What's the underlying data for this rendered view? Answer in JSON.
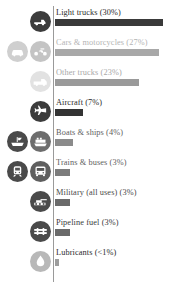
{
  "chart_data": {
    "type": "bar",
    "title": "",
    "subtitle": "",
    "xlabel": "",
    "ylabel": "",
    "orientation": "horizontal",
    "grid": false,
    "legend": "none",
    "xlim": [
      0,
      30
    ],
    "categories": [
      "Light trucks",
      "Cars & motorcycles",
      "Other trucks",
      "Aircraft",
      "Boats & ships",
      "Trains & buses",
      "Military (all uses)",
      "Pipeline fuel",
      "Lubricants"
    ],
    "values": [
      30,
      27,
      23,
      7,
      4,
      3,
      3,
      3,
      0.5
    ],
    "value_labels": [
      "30%",
      "27%",
      "23%",
      "7%",
      "4%",
      "3%",
      "3%",
      "3%",
      "<1%"
    ],
    "bar_colors": [
      "#3a3a3a",
      "#9d9d9d",
      "#8f8f8f",
      "#333333",
      "#8f8f8f",
      "#8f8f8f",
      "#5a5a5a",
      "#5a5a5a",
      "#9d9d9d"
    ]
  },
  "colors": {
    "dark": "#3a3a3a",
    "mid": "#8f8f8f",
    "light": "#b9b9b9",
    "axis": "#9a9a9a",
    "text_dark": "#2b2b2b",
    "text_light": "#b0b0b0",
    "text_mid": "#6f6f6f"
  },
  "rows": [
    {
      "key": "light-trucks",
      "label": "Light trucks (30%)",
      "percent": 30,
      "bar_width_px": 108,
      "bar_color": "#3a3a3a",
      "label_color": "#2b2b2b",
      "icons": [
        {
          "name": "pickup-truck-icon",
          "glyph": "truck",
          "badge_color": "#3c3c3c",
          "mark_color": "#ffffff"
        }
      ]
    },
    {
      "key": "cars-motorcycles",
      "label": "Cars & motorcycles (27%)",
      "percent": 27,
      "bar_width_px": 104,
      "bar_color": "#a8a8a8",
      "label_color": "#b4b4b4",
      "icons": [
        {
          "name": "car-icon",
          "glyph": "car",
          "badge_color": "#cfcfcf",
          "mark_color": "#ffffff"
        },
        {
          "name": "motorcycle-icon",
          "glyph": "motorcycle",
          "badge_color": "#c4c4c4",
          "mark_color": "#ffffff"
        }
      ]
    },
    {
      "key": "other-trucks",
      "label": "Other trucks (23%)",
      "percent": 23,
      "bar_width_px": 84,
      "bar_color": "#9a9a9a",
      "label_color": "#a8a8a8",
      "icons": [
        {
          "name": "semi-truck-icon",
          "glyph": "semi",
          "badge_color": "#e2e2e2",
          "mark_color": "#ffffff"
        }
      ]
    },
    {
      "key": "aircraft",
      "label": "Aircraft (7%)",
      "percent": 7,
      "bar_width_px": 28,
      "bar_color": "#333333",
      "label_color": "#2b2b2b",
      "icons": [
        {
          "name": "airplane-icon",
          "glyph": "plane",
          "badge_color": "#3c3c3c",
          "mark_color": "#ffffff"
        }
      ]
    },
    {
      "key": "boats-ships",
      "label": "Boats & ships (4%)",
      "percent": 4,
      "bar_width_px": 18,
      "bar_color": "#8b8b8b",
      "label_color": "#5e5e5e",
      "icons": [
        {
          "name": "boat-icon",
          "glyph": "boat",
          "badge_color": "#4a4a4a",
          "mark_color": "#ffffff"
        },
        {
          "name": "ship-icon",
          "glyph": "ship",
          "badge_color": "#6d6d6d",
          "mark_color": "#ffffff"
        }
      ]
    },
    {
      "key": "trains-buses",
      "label": "Trains & buses (3%)",
      "percent": 3,
      "bar_width_px": 15,
      "bar_color": "#7c7c7c",
      "label_color": "#5e5e5e",
      "icons": [
        {
          "name": "train-icon",
          "glyph": "train",
          "badge_color": "#4a4a4a",
          "mark_color": "#ffffff"
        },
        {
          "name": "bus-icon",
          "glyph": "bus",
          "badge_color": "#5f5f5f",
          "mark_color": "#ffffff"
        }
      ]
    },
    {
      "key": "military",
      "label": "Military (all uses) (3%)",
      "percent": 3,
      "bar_width_px": 15,
      "bar_color": "#6a6a6a",
      "label_color": "#4a4a4a",
      "icons": [
        {
          "name": "tank-icon",
          "glyph": "tank",
          "badge_color": "#4a4a4a",
          "mark_color": "#ffffff"
        }
      ]
    },
    {
      "key": "pipeline-fuel",
      "label": "Pipeline fuel (3%)",
      "percent": 3,
      "bar_width_px": 15,
      "bar_color": "#6a6a6a",
      "label_color": "#3a3a3a",
      "icons": [
        {
          "name": "pipeline-icon",
          "glyph": "pipeline",
          "badge_color": "#4a4a4a",
          "mark_color": "#ffffff"
        }
      ]
    },
    {
      "key": "lubricants",
      "label": "Lubricants (<1%)",
      "percent": 0.5,
      "bar_width_px": 4,
      "bar_color": "#9d9d9d",
      "label_color": "#2b2b2b",
      "icons": [
        {
          "name": "oil-drop-icon",
          "glyph": "drop",
          "badge_color": "#b8b8b8",
          "mark_color": "#ffffff"
        }
      ]
    }
  ]
}
